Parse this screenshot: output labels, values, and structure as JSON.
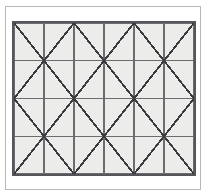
{
  "figure": {
    "title": "",
    "caption": "",
    "background_color": "#ffffff",
    "outer_frame_color": "#b7b7b4",
    "panel_background_color": "#ececea",
    "panel_border_color": "#55555a",
    "grid_line_color": "#6b6b70",
    "diagonal_line_color": "#3a3a3f"
  },
  "chart_data": {
    "type": "diagram",
    "title": "",
    "xlabel": "",
    "ylabel": "",
    "grid": {
      "columns": 6,
      "rows": 4,
      "panel_inner_width_px": 180,
      "panel_inner_height_px": 151,
      "cell_width_px": 30,
      "cell_height_px": 37.75,
      "vertical_line_positions": [
        0,
        1,
        2,
        3,
        4,
        5,
        6
      ],
      "horizontal_line_positions": [
        0,
        1,
        2,
        3,
        4
      ],
      "grid_on": true,
      "grid_line_width_px": 1.3,
      "diagonal_line_width_px": 1.9
    },
    "cells": [
      {
        "row": 0,
        "col": 0,
        "diagonal": "backslash"
      },
      {
        "row": 0,
        "col": 1,
        "diagonal": "slash"
      },
      {
        "row": 0,
        "col": 2,
        "diagonal": "backslash"
      },
      {
        "row": 0,
        "col": 3,
        "diagonal": "slash"
      },
      {
        "row": 0,
        "col": 4,
        "diagonal": "backslash"
      },
      {
        "row": 0,
        "col": 5,
        "diagonal": "slash"
      },
      {
        "row": 1,
        "col": 0,
        "diagonal": "slash"
      },
      {
        "row": 1,
        "col": 1,
        "diagonal": "backslash"
      },
      {
        "row": 1,
        "col": 2,
        "diagonal": "slash"
      },
      {
        "row": 1,
        "col": 3,
        "diagonal": "backslash"
      },
      {
        "row": 1,
        "col": 4,
        "diagonal": "slash"
      },
      {
        "row": 1,
        "col": 5,
        "diagonal": "backslash"
      },
      {
        "row": 2,
        "col": 0,
        "diagonal": "backslash"
      },
      {
        "row": 2,
        "col": 1,
        "diagonal": "slash"
      },
      {
        "row": 2,
        "col": 2,
        "diagonal": "backslash"
      },
      {
        "row": 2,
        "col": 3,
        "diagonal": "slash"
      },
      {
        "row": 2,
        "col": 4,
        "diagonal": "backslash"
      },
      {
        "row": 2,
        "col": 5,
        "diagonal": "slash"
      },
      {
        "row": 3,
        "col": 0,
        "diagonal": "slash"
      },
      {
        "row": 3,
        "col": 1,
        "diagonal": "backslash"
      },
      {
        "row": 3,
        "col": 2,
        "diagonal": "slash"
      },
      {
        "row": 3,
        "col": 3,
        "diagonal": "backslash"
      },
      {
        "row": 3,
        "col": 4,
        "diagonal": "slash"
      },
      {
        "row": 3,
        "col": 5,
        "diagonal": "backslash"
      }
    ],
    "vertices": [
      {
        "row": 1,
        "col": 1,
        "type": "x-junction"
      },
      {
        "row": 1,
        "col": 3,
        "type": "x-junction"
      },
      {
        "row": 1,
        "col": 5,
        "type": "x-junction"
      },
      {
        "row": 2,
        "col": 0,
        "type": "x-junction"
      },
      {
        "row": 2,
        "col": 2,
        "type": "x-junction"
      },
      {
        "row": 2,
        "col": 4,
        "type": "x-junction"
      },
      {
        "row": 2,
        "col": 6,
        "type": "x-junction"
      },
      {
        "row": 3,
        "col": 1,
        "type": "x-junction"
      },
      {
        "row": 3,
        "col": 3,
        "type": "x-junction"
      },
      {
        "row": 3,
        "col": 5,
        "type": "x-junction"
      }
    ]
  }
}
